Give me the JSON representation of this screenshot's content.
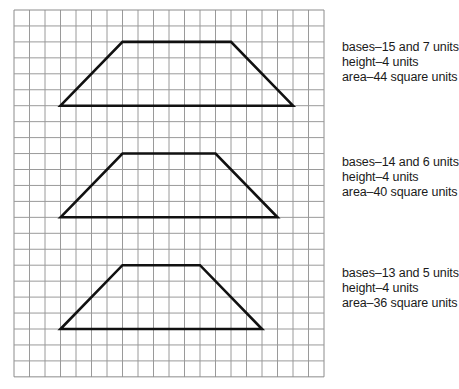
{
  "grid": {
    "left": 14,
    "top": 10,
    "columns": 20,
    "rows": 23,
    "cell_width": 15.5,
    "cell_height": 15.95,
    "line_color": "#9a9a9a",
    "border_color": "#8c8c8c"
  },
  "trapezoids": [
    {
      "id": "trapezoid-1",
      "vertices_grid": [
        [
          3,
          6
        ],
        [
          7,
          2
        ],
        [
          14,
          2
        ],
        [
          18,
          6
        ]
      ],
      "labels": {
        "bases": "bases–15 and 7 units",
        "height": "height–4 units",
        "area": "area–44 square units"
      },
      "label_top": 40
    },
    {
      "id": "trapezoid-2",
      "vertices_grid": [
        [
          3,
          13
        ],
        [
          7,
          9
        ],
        [
          13,
          9
        ],
        [
          17,
          13
        ]
      ],
      "labels": {
        "bases": "bases–14 and 6 units",
        "height": "height–4 units",
        "area": "area–40 square units"
      },
      "label_top": 155
    },
    {
      "id": "trapezoid-3",
      "vertices_grid": [
        [
          3,
          20
        ],
        [
          7,
          16
        ],
        [
          12,
          16
        ],
        [
          16,
          20
        ]
      ],
      "labels": {
        "bases": "bases–13 and 5 units",
        "height": "height–4 units",
        "area": "area–36 square units"
      },
      "label_top": 266
    }
  ],
  "stroke": {
    "color": "#111111",
    "width": 2.6
  }
}
